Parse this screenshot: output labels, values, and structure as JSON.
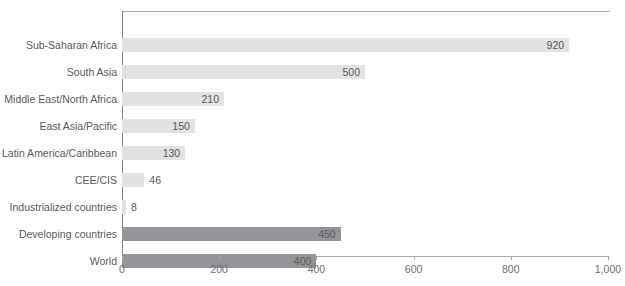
{
  "chart_data": {
    "type": "bar",
    "orientation": "horizontal",
    "title": "",
    "xlabel": "",
    "ylabel": "",
    "xlim": [
      0,
      1000
    ],
    "xticks": [
      0,
      200,
      400,
      600,
      800,
      1000
    ],
    "xtick_labels": [
      "0",
      "200",
      "400",
      "600",
      "800",
      "1,000"
    ],
    "grid": false,
    "legend": false,
    "categories": [
      "Sub-Saharan Africa",
      "South Asia",
      "Middle East/North Africa",
      "East Asia/Pacific",
      "Latin America/Caribbean",
      "CEE/CIS",
      "Industrialized countries",
      "Developing countries",
      "World"
    ],
    "values": [
      920,
      500,
      210,
      150,
      130,
      46,
      8,
      450,
      400
    ],
    "value_labels": [
      "920",
      "500",
      "210",
      "150",
      "130",
      "46",
      "8",
      "450",
      "400"
    ],
    "bars": [
      {
        "category": "Sub-Saharan Africa",
        "value": 920,
        "label": "920",
        "group": "region",
        "color": "#e2e2e2",
        "label_position": "inside"
      },
      {
        "category": "South Asia",
        "value": 500,
        "label": "500",
        "group": "region",
        "color": "#e2e2e2",
        "label_position": "inside"
      },
      {
        "category": "Middle East/North Africa",
        "value": 210,
        "label": "210",
        "group": "region",
        "color": "#e2e2e2",
        "label_position": "inside"
      },
      {
        "category": "East Asia/Pacific",
        "value": 150,
        "label": "150",
        "group": "region",
        "color": "#e2e2e2",
        "label_position": "inside"
      },
      {
        "category": "Latin America/Caribbean",
        "value": 130,
        "label": "130",
        "group": "region",
        "color": "#e2e2e2",
        "label_position": "inside"
      },
      {
        "category": "CEE/CIS",
        "value": 46,
        "label": "46",
        "group": "region",
        "color": "#e2e2e2",
        "label_position": "outside"
      },
      {
        "category": "Industrialized countries",
        "value": 8,
        "label": "8",
        "group": "region",
        "color": "#e2e2e2",
        "label_position": "outside"
      },
      {
        "category": "Developing countries",
        "value": 450,
        "label": "450",
        "group": "aggregate",
        "color": "#939598",
        "label_position": "inside"
      },
      {
        "category": "World",
        "value": 400,
        "label": "400",
        "group": "aggregate",
        "color": "#939598",
        "label_position": "inside"
      }
    ],
    "colors": {
      "region_bar": "#e2e2e2",
      "aggregate_bar": "#939598",
      "axis_line": "#a7a9ac",
      "text": "#58595b",
      "background": "#ffffff"
    }
  }
}
